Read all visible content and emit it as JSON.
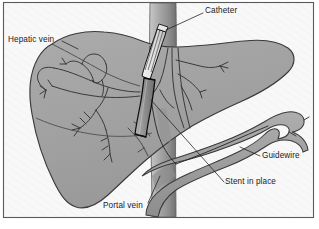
{
  "figure": {
    "type": "medical-illustration",
    "border_color": "#555555",
    "background_color": "#f7f7f7"
  },
  "labels": [
    {
      "id": "hepatic-vein",
      "text": "Hepatic vein",
      "x": 8,
      "y": 36
    },
    {
      "id": "catheter",
      "text": "Catheter",
      "x": 205,
      "y": 7
    },
    {
      "id": "guidewire",
      "text": "Guidewire",
      "x": 262,
      "y": 152
    },
    {
      "id": "stent",
      "text": "Stent in place",
      "x": 225,
      "y": 178
    },
    {
      "id": "portal-vein",
      "text": "Portal vein",
      "x": 103,
      "y": 202
    }
  ],
  "anatomy": {
    "liver": {
      "name": "Liver",
      "fill": "#a3a3a3",
      "stroke": "#3a3a3a"
    },
    "vena_cava": {
      "name": "Inferior vena cava",
      "fill": "#9a9a9a",
      "stroke": "#4a4a4a"
    },
    "portal_vein": {
      "name": "Portal vein",
      "fill": "#9e9e9e",
      "stroke": "#3a3a3a"
    },
    "hepatic_vein": {
      "name": "Hepatic vein tree",
      "fill": "none",
      "stroke": "#3a3a3a"
    }
  },
  "devices": {
    "catheter": {
      "name": "Catheter",
      "fill": "#efefef",
      "stroke": "#111111"
    },
    "stent": {
      "name": "Stent",
      "fill": "#8f8f8f",
      "stroke": "#111111"
    },
    "guidewire": {
      "name": "Guidewire",
      "stroke": "#2a2a2a"
    }
  },
  "leader_lines": {
    "stroke": "#1c1c1c",
    "width": 0.7
  }
}
